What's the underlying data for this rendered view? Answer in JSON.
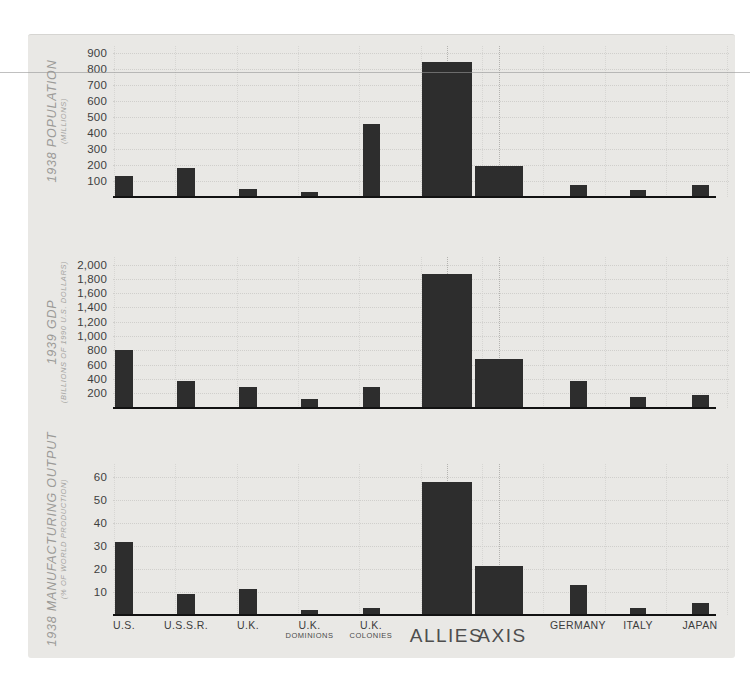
{
  "page": {
    "background": "#ffffff",
    "card_color": "#e9e8e5",
    "bar_color": "#2d2d2d",
    "axis_line_color": "#121212",
    "grid_color": "#d0cfcc",
    "accent_grid_color": "#b4b3b0",
    "horizontal_rule_color": "#969696",
    "tick_label_color": "#3e3e3e",
    "category_label_color": "#3c3c3c",
    "axis_title_color": "#9b9a97",
    "group_label_color": "#4e4e4e"
  },
  "x_axis": {
    "categories": [
      {
        "id": "us",
        "label": "U.S."
      },
      {
        "id": "ussr",
        "label": "U.S.S.R."
      },
      {
        "id": "uk",
        "label": "U.K."
      },
      {
        "id": "uk-dominions",
        "label": "U.K.",
        "sub": "DOMINIONS"
      },
      {
        "id": "uk-colonies",
        "label": "U.K.",
        "sub": "COLONIES"
      },
      {
        "id": "allies",
        "label": "ALLIES",
        "group": true
      },
      {
        "id": "axis",
        "label": "AXIS",
        "group": true
      },
      {
        "id": "germany",
        "label": "GERMANY"
      },
      {
        "id": "italy",
        "label": "ITALY"
      },
      {
        "id": "japan",
        "label": "JAPAN"
      }
    ],
    "group_label": {
      "left": "ALLIES",
      "right": "AXIS"
    }
  },
  "chart_data": [
    {
      "type": "bar",
      "id": "population",
      "title": "1938 POPULATION",
      "unit_label": "(MILLIONS)",
      "categories": [
        "U.S.",
        "U.S.S.R.",
        "U.K.",
        "U.K. DOMINIONS",
        "U.K. COLONIES",
        "ALLIES",
        "AXIS",
        "GERMANY",
        "ITALY",
        "JAPAN"
      ],
      "values": [
        130,
        180,
        48,
        30,
        454,
        842,
        190,
        75,
        43,
        72
      ],
      "ylabel": "1938 POPULATION (MILLIONS)",
      "yticks": [
        100,
        200,
        300,
        400,
        500,
        600,
        700,
        800,
        900
      ],
      "ytick_labels": [
        "100",
        "200",
        "300",
        "400",
        "500",
        "600",
        "700",
        "800",
        "900"
      ],
      "ylim": [
        0,
        950
      ],
      "grid": true,
      "legend": "none"
    },
    {
      "type": "bar",
      "id": "gdp",
      "title": "1939 GDP",
      "unit_label": "(BILLIONS OF 1990 U.S. DOLLARS)",
      "categories": [
        "U.S.",
        "U.S.S.R.",
        "U.K.",
        "U.K. DOMINIONS",
        "U.K. COLONIES",
        "ALLIES",
        "AXIS",
        "GERMANY",
        "ITALY",
        "JAPAN"
      ],
      "values": [
        810,
        366,
        287,
        120,
        280,
        1863,
        685,
        370,
        145,
        180
      ],
      "ylabel": "1939 GDP (BILLIONS OF 1990 U.S. DOLLARS)",
      "yticks": [
        200,
        400,
        600,
        800,
        1000,
        1200,
        1400,
        1600,
        1800,
        2000
      ],
      "ytick_labels": [
        "200",
        "400",
        "600",
        "800",
        "1,000",
        "1,200",
        "1,400",
        "1,600",
        "1,800",
        "2,000"
      ],
      "ylim": [
        0,
        2100
      ],
      "grid": true,
      "legend": "none"
    },
    {
      "type": "bar",
      "id": "manufacturing",
      "title": "1938 MANUFACTURING OUTPUT",
      "unit_label": "(% OF WORLD PRODUCTION)",
      "categories": [
        "U.S.",
        "U.S.S.R.",
        "U.K.",
        "U.K. DOMINIONS",
        "U.K. COLONIES",
        "ALLIES",
        "AXIS",
        "GERMANY",
        "ITALY",
        "JAPAN"
      ],
      "values": [
        31.5,
        9,
        11,
        2,
        3,
        58,
        21,
        13,
        2.8,
        5
      ],
      "ylabel": "1938 MANUFACTURING OUTPUT (% OF WORLD PRODUCTION)",
      "yticks": [
        10,
        20,
        30,
        40,
        50,
        60
      ],
      "ytick_labels": [
        "10",
        "20",
        "30",
        "40",
        "50",
        "60"
      ],
      "ylim": [
        0,
        62
      ],
      "grid": true,
      "legend": "none"
    }
  ]
}
